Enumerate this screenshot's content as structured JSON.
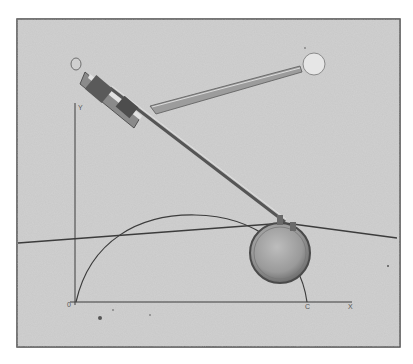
{
  "figure": {
    "axis_labels": {
      "y": "Y",
      "origin": "0",
      "c": "C",
      "x": "X"
    },
    "colors": {
      "background": "#c9c9c9",
      "frame": "#4a4a4a",
      "lines": "#3c3c3c",
      "metal_light": "#e8e8e8",
      "metal_dark": "#555555"
    }
  }
}
